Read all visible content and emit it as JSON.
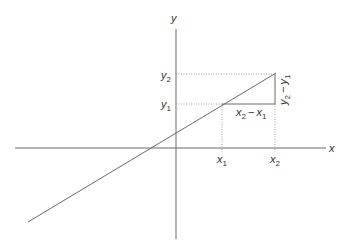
{
  "diagram": {
    "axes": {
      "x_label": "x",
      "y_label": "y"
    },
    "ticks": {
      "x1": {
        "base": "x",
        "sub": "1"
      },
      "x2": {
        "base": "x",
        "sub": "2"
      },
      "y1": {
        "base": "y",
        "sub": "1"
      },
      "y2": {
        "base": "y",
        "sub": "2"
      }
    },
    "annotations": {
      "run": {
        "a": "x",
        "a_sub": "2",
        "op": "−",
        "b": "x",
        "b_sub": "1"
      },
      "rise": {
        "a": "y",
        "a_sub": "2",
        "op": "−",
        "b": "y",
        "b_sub": "1"
      }
    },
    "colors": {
      "line": "#6a6a6a",
      "guide": "#8a8a8a",
      "text": "#333333",
      "background": "#ffffff"
    }
  }
}
